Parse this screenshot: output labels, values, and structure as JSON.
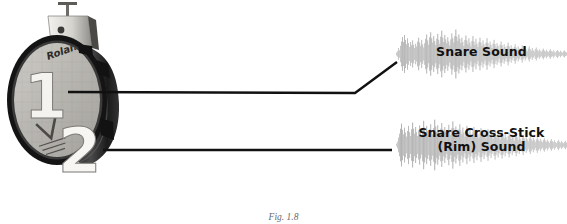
{
  "figure": {
    "caption": "Fig. 1.8",
    "background_color": "#ffffff",
    "line_color": "#111111",
    "waveform_color": "#9a9a9a",
    "label_color": "#111111"
  },
  "drum_pad": {
    "name": "Roland dual-zone snare pad",
    "brand_text": "Roland",
    "zone_1_number": "1",
    "zone_2_number": "2",
    "head_color": "#b9b7b2",
    "rim_color": "#1f1f1f",
    "hardware_color": "#d8d6d1"
  },
  "callouts": [
    {
      "id": "snare-head",
      "source_number": "1",
      "line_kind": "bent",
      "label": "Snare Sound"
    },
    {
      "id": "snare-rim",
      "source_number": "2",
      "line_kind": "straight",
      "label": "Snare Cross-Stick\n(Rim) Sound"
    }
  ],
  "waveforms": [
    {
      "id": "snare-sound",
      "label": "Snare Sound",
      "amplitudes": [
        0.06,
        0.1,
        0.22,
        0.14,
        0.3,
        0.46,
        0.62,
        0.44,
        0.7,
        0.52,
        0.36,
        0.58,
        0.4,
        0.26,
        0.44,
        0.32,
        0.5,
        0.34,
        0.22,
        0.38,
        0.28,
        0.46,
        0.6,
        0.42,
        0.3,
        0.52,
        0.36,
        0.24,
        0.4,
        0.56,
        0.72,
        0.5,
        0.34,
        0.62,
        0.8,
        0.58,
        0.42,
        0.66,
        0.48,
        0.34,
        0.56,
        0.74,
        0.52,
        0.38,
        0.64,
        0.86,
        0.6,
        0.44,
        0.7,
        0.54,
        0.4,
        0.62,
        0.46,
        0.32,
        0.54,
        0.76,
        0.58,
        0.42,
        0.66,
        0.9,
        0.64,
        0.48,
        0.72,
        0.56,
        0.4,
        0.6,
        0.44,
        0.3,
        0.52,
        0.68,
        0.5,
        0.36,
        0.58,
        0.42,
        0.28,
        0.48,
        0.66,
        0.46,
        0.34,
        0.56,
        0.38,
        0.26,
        0.44,
        0.6,
        0.42,
        0.3,
        0.5,
        0.36,
        0.24,
        0.42,
        0.58,
        0.4,
        0.28,
        0.46,
        0.34,
        0.22,
        0.38,
        0.52,
        0.36,
        0.24,
        0.4,
        0.3,
        0.18,
        0.34,
        0.46,
        0.32,
        0.2,
        0.36,
        0.26,
        0.16,
        0.3,
        0.42,
        0.28,
        0.18,
        0.32,
        0.22,
        0.14,
        0.26,
        0.36,
        0.24,
        0.16,
        0.28,
        0.2,
        0.12,
        0.22,
        0.32,
        0.2,
        0.14,
        0.24,
        0.16,
        0.1,
        0.2,
        0.28,
        0.18,
        0.12,
        0.22,
        0.14,
        0.09,
        0.18,
        0.24,
        0.15,
        0.1,
        0.18,
        0.12,
        0.08,
        0.15,
        0.2,
        0.13,
        0.09,
        0.16,
        0.11,
        0.07,
        0.13,
        0.18,
        0.11,
        0.08,
        0.14,
        0.09,
        0.06,
        0.11,
        0.15,
        0.1,
        0.07,
        0.12,
        0.08,
        0.05,
        0.1,
        0.13,
        0.08,
        0.06
      ]
    },
    {
      "id": "snare-cross-stick-sound",
      "label": "Snare Cross-Stick (Rim) Sound",
      "amplitudes": [
        0.05,
        0.12,
        0.26,
        0.4,
        0.58,
        0.76,
        0.54,
        0.38,
        0.62,
        0.44,
        0.3,
        0.5,
        0.68,
        0.46,
        0.32,
        0.56,
        0.8,
        0.58,
        0.4,
        0.64,
        0.46,
        0.32,
        0.52,
        0.7,
        0.48,
        0.34,
        0.58,
        0.86,
        0.62,
        0.44,
        0.68,
        0.5,
        0.36,
        0.56,
        0.74,
        0.52,
        0.38,
        0.6,
        0.9,
        0.66,
        0.46,
        0.7,
        0.52,
        0.38,
        0.58,
        0.78,
        0.56,
        0.4,
        0.64,
        0.46,
        0.32,
        0.54,
        0.72,
        0.5,
        0.36,
        0.6,
        0.84,
        0.6,
        0.42,
        0.66,
        0.48,
        0.34,
        0.56,
        0.74,
        0.52,
        0.38,
        0.62,
        0.44,
        0.3,
        0.5,
        0.68,
        0.46,
        0.34,
        0.58,
        0.4,
        0.28,
        0.48,
        0.64,
        0.44,
        0.32,
        0.54,
        0.38,
        0.26,
        0.44,
        0.6,
        0.42,
        0.3,
        0.5,
        0.36,
        0.24,
        0.42,
        0.56,
        0.38,
        0.28,
        0.46,
        0.32,
        0.22,
        0.38,
        0.52,
        0.36,
        0.26,
        0.44,
        0.3,
        0.2,
        0.36,
        0.48,
        0.34,
        0.24,
        0.4,
        0.28,
        0.18,
        0.32,
        0.44,
        0.3,
        0.22,
        0.36,
        0.26,
        0.16,
        0.28,
        0.4,
        0.28,
        0.18,
        0.32,
        0.22,
        0.14,
        0.26,
        0.36,
        0.24,
        0.16,
        0.28,
        0.2,
        0.13,
        0.24,
        0.32,
        0.22,
        0.15,
        0.26,
        0.18,
        0.11,
        0.2,
        0.28,
        0.19,
        0.13,
        0.22,
        0.15,
        0.1,
        0.18,
        0.24,
        0.16,
        0.11,
        0.19,
        0.13,
        0.08,
        0.15,
        0.21,
        0.14,
        0.1,
        0.17,
        0.11,
        0.07,
        0.13,
        0.18,
        0.12,
        0.08,
        0.14,
        0.1,
        0.06,
        0.11,
        0.15,
        0.09
      ]
    }
  ]
}
